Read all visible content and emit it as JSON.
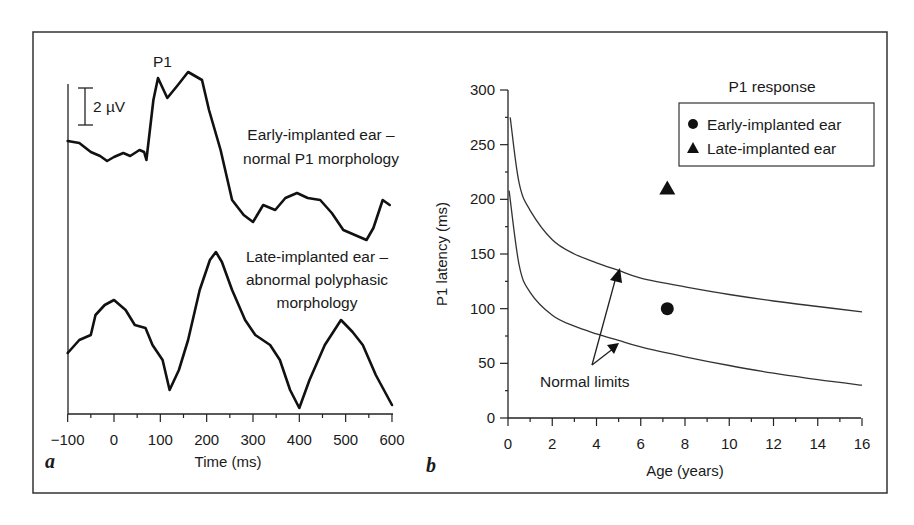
{
  "figure": {
    "frame_color": "#333333",
    "line_color": "#111111"
  },
  "chart_data": [
    {
      "panel": "a",
      "type": "line",
      "title": "",
      "xlabel": "Time (ms)",
      "ylabel": "",
      "xlim": [
        -100,
        600
      ],
      "xticks": [
        "−100",
        "0",
        "100",
        "200",
        "300",
        "400",
        "500",
        "600"
      ],
      "scale_bar_label": "2 µV",
      "peak_label": "P1",
      "grid": false,
      "series": [
        {
          "name": "Early-implanted ear – normal P1 morphology",
          "label_line1": "Early-implanted ear –",
          "label_line2": "normal P1 morphology",
          "x": [
            -100,
            -75,
            -50,
            -30,
            -15,
            0,
            20,
            35,
            55,
            65,
            70,
            85,
            95,
            115,
            138,
            160,
            190,
            205,
            230,
            255,
            280,
            300,
            322,
            348,
            370,
            395,
            418,
            445,
            470,
            495,
            520,
            545,
            560,
            580,
            595
          ],
          "y": [
            141,
            143,
            152,
            156,
            161,
            157,
            153,
            156,
            150,
            152,
            160,
            100,
            78,
            98,
            85,
            72,
            80,
            110,
            150,
            200,
            215,
            222,
            205,
            210,
            198,
            193,
            198,
            200,
            213,
            230,
            235,
            240,
            228,
            200,
            205
          ],
          "y_units": "pixel (trace shape)"
        },
        {
          "name": "Late-implanted ear – abnormal polyphasic morphology",
          "label_line1": "Late-implanted ear –",
          "label_line2": "abnormal polyphasic",
          "label_line3": "morphology",
          "x": [
            -100,
            -75,
            -50,
            -40,
            -20,
            0,
            25,
            45,
            68,
            83,
            105,
            120,
            140,
            160,
            185,
            207,
            220,
            233,
            255,
            283,
            305,
            337,
            358,
            380,
            400,
            422,
            455,
            490,
            515,
            537,
            565,
            600
          ],
          "y": [
            353,
            340,
            335,
            315,
            305,
            300,
            310,
            325,
            328,
            345,
            360,
            390,
            370,
            340,
            290,
            260,
            252,
            262,
            290,
            320,
            335,
            345,
            360,
            390,
            408,
            380,
            345,
            320,
            332,
            345,
            375,
            405
          ],
          "y_units": "pixel (trace shape)"
        }
      ]
    },
    {
      "panel": "b",
      "type": "scatter",
      "title": "P1 response",
      "xlabel": "Age (years)",
      "ylabel": "P1 latency (ms)",
      "xlim": [
        0,
        16
      ],
      "ylim": [
        0,
        300
      ],
      "xticks": [
        "0",
        "2",
        "4",
        "6",
        "8",
        "10",
        "12",
        "14",
        "16"
      ],
      "yticks": [
        "0",
        "50",
        "100",
        "150",
        "200",
        "250",
        "300"
      ],
      "grid": false,
      "legend_position": "upper right",
      "legend": [
        {
          "marker": "circle",
          "label": "Early-implanted ear"
        },
        {
          "marker": "triangle",
          "label": "Late-implanted ear"
        }
      ],
      "points": [
        {
          "series": "Early-implanted ear",
          "marker": "circle",
          "x": 7.2,
          "y": 100
        },
        {
          "series": "Late-implanted ear",
          "marker": "triangle",
          "x": 7.2,
          "y": 210
        }
      ],
      "normal_limits": {
        "annotation": "Normal limits",
        "upper": {
          "x": [
            0.1,
            0.5,
            1,
            2,
            3,
            4,
            5,
            6,
            8,
            10,
            12,
            14,
            16
          ],
          "y": [
            275,
            215,
            190,
            163,
            150,
            142,
            135,
            128,
            120,
            113,
            107,
            102,
            97
          ]
        },
        "lower": {
          "x": [
            0.05,
            0.5,
            1,
            2,
            3,
            4,
            5,
            6,
            8,
            10,
            12,
            14,
            16
          ],
          "y": [
            208,
            140,
            115,
            94,
            84,
            77,
            71,
            65,
            56,
            48,
            41,
            35,
            30
          ]
        }
      }
    }
  ]
}
